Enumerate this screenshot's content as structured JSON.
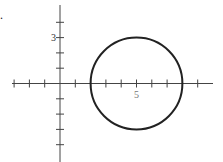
{
  "problem_marker": ".",
  "axes": {
    "x_label_5": "5",
    "y_label_3": "3",
    "origin_px": [
      60,
      83.5
    ],
    "unit_px": 15.3,
    "x_ticks": [
      -3,
      -2,
      -1,
      1,
      2,
      3,
      4,
      5,
      6,
      7,
      8,
      9
    ],
    "y_ticks": [
      -4,
      -3,
      -2,
      -1,
      1,
      2,
      3,
      4
    ],
    "x_range_px": [
      12,
      213
    ],
    "y_range_px": [
      5,
      162
    ]
  },
  "circle": {
    "center": [
      5,
      0
    ],
    "radius": 3,
    "stroke": "#222222"
  },
  "colors": {
    "axis": "#444444",
    "circle": "#222222"
  }
}
